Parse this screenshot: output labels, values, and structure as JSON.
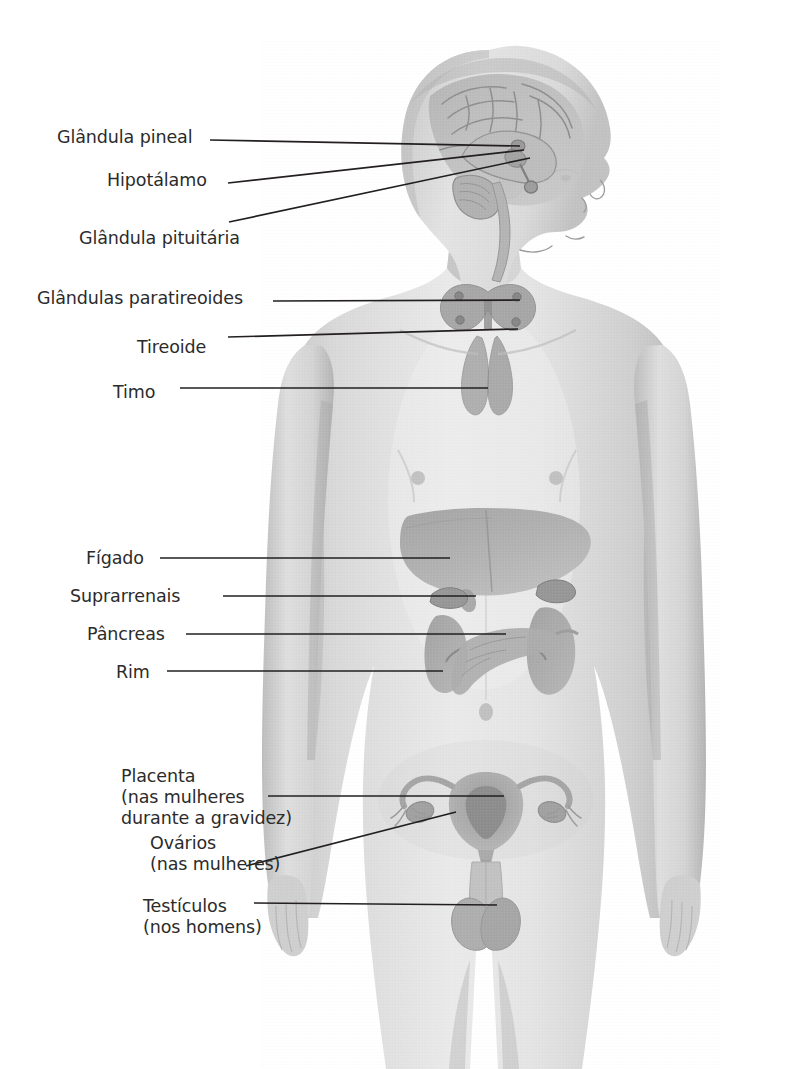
{
  "figure": {
    "style": "grayscale halftone anatomical illustration",
    "orientation": "standing male figure, anterior view, head in right profile",
    "background_color": "#ffffff",
    "line_color": "#231f20",
    "text_color": "#2b2b2b"
  },
  "labels": [
    {
      "id": "pineal",
      "lines": [
        "Glândula pineal"
      ],
      "x": 57,
      "y": 127,
      "align": "left",
      "leader": {
        "from_x": 210,
        "from_y": 140,
        "to_x": 520,
        "to_y": 146
      }
    },
    {
      "id": "hipotalamo",
      "lines": [
        "Hipotálamo"
      ],
      "x": 107,
      "y": 170,
      "align": "left",
      "leader": {
        "from_x": 228,
        "from_y": 183,
        "to_x": 524,
        "to_y": 150
      }
    },
    {
      "id": "pituitaria",
      "lines": [
        "Glândula pituitária"
      ],
      "x": 79,
      "y": 228,
      "align": "left",
      "leader": {
        "from_x": 229,
        "from_y": 222,
        "to_x": 530,
        "to_y": 158
      }
    },
    {
      "id": "paratireoides",
      "lines": [
        "Glândulas paratireoides"
      ],
      "x": 37,
      "y": 288,
      "align": "left",
      "leader": {
        "from_x": 273,
        "from_y": 301,
        "to_x": 520,
        "to_y": 300
      }
    },
    {
      "id": "tireoide",
      "lines": [
        "Tireoide"
      ],
      "x": 137,
      "y": 337,
      "align": "left",
      "leader": {
        "from_x": 228,
        "from_y": 337,
        "to_x": 518,
        "to_y": 329
      }
    },
    {
      "id": "timo",
      "lines": [
        "Timo"
      ],
      "x": 113,
      "y": 382,
      "align": "left",
      "leader": {
        "from_x": 180,
        "from_y": 388,
        "to_x": 488,
        "to_y": 388
      }
    },
    {
      "id": "figado",
      "lines": [
        "Fígado"
      ],
      "x": 86,
      "y": 548,
      "align": "left",
      "leader": {
        "from_x": 160,
        "from_y": 558,
        "to_x": 450,
        "to_y": 558
      }
    },
    {
      "id": "suprarrenais",
      "lines": [
        "Suprarrenais"
      ],
      "x": 70,
      "y": 586,
      "align": "left",
      "leader": {
        "from_x": 223,
        "from_y": 596,
        "to_x": 476,
        "to_y": 596
      }
    },
    {
      "id": "pancreas",
      "lines": [
        "Pâncreas"
      ],
      "x": 87,
      "y": 624,
      "align": "left",
      "leader": {
        "from_x": 186,
        "from_y": 634,
        "to_x": 506,
        "to_y": 634
      }
    },
    {
      "id": "rim",
      "lines": [
        "Rim"
      ],
      "x": 116,
      "y": 662,
      "align": "left",
      "leader": {
        "from_x": 167,
        "from_y": 671,
        "to_x": 443,
        "to_y": 671
      }
    },
    {
      "id": "placenta",
      "lines": [
        "Placenta",
        "(nas mulheres",
        "durante a gravidez)"
      ],
      "x": 121,
      "y": 766,
      "align": "left",
      "leader": {
        "from_x": 268,
        "from_y": 796,
        "to_x": 504,
        "to_y": 796
      }
    },
    {
      "id": "ovarios",
      "lines": [
        "Ovários",
        "(nas mulheres)"
      ],
      "x": 150,
      "y": 833,
      "align": "left",
      "leader": {
        "from_x": 246,
        "from_y": 866,
        "to_x": 456,
        "to_y": 812
      }
    },
    {
      "id": "testiculos",
      "lines": [
        "Testículos",
        "(nos homens)"
      ],
      "x": 143,
      "y": 896,
      "align": "left",
      "leader": {
        "from_x": 254,
        "from_y": 903,
        "to_x": 497,
        "to_y": 905
      }
    }
  ],
  "organs": [
    {
      "id": "brain",
      "name": "Cérebro (corte sagital)"
    },
    {
      "id": "pineal-gland",
      "name": "Glândula pineal"
    },
    {
      "id": "hypothalamus",
      "name": "Hipotálamo"
    },
    {
      "id": "pituitary",
      "name": "Glândula pituitária"
    },
    {
      "id": "thyroid",
      "name": "Tireoide"
    },
    {
      "id": "parathyroid",
      "name": "Glândulas paratireoides"
    },
    {
      "id": "thymus",
      "name": "Timo"
    },
    {
      "id": "liver",
      "name": "Fígado"
    },
    {
      "id": "adrenals",
      "name": "Suprarrenais"
    },
    {
      "id": "pancreas",
      "name": "Pâncreas"
    },
    {
      "id": "kidneys",
      "name": "Rim"
    },
    {
      "id": "uterus",
      "name": "Útero / Placenta"
    },
    {
      "id": "ovaries",
      "name": "Ovários"
    },
    {
      "id": "testes",
      "name": "Testículos"
    }
  ]
}
